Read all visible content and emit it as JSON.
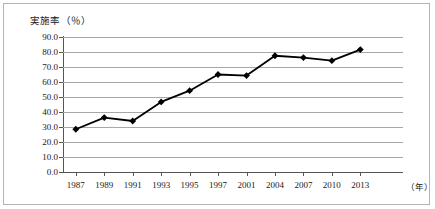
{
  "chart_data": {
    "type": "line",
    "title": "実施率（％）",
    "xlabel": "（年）",
    "ylabel": "実施率（％）",
    "categories": [
      "1987",
      "1989",
      "1991",
      "1993",
      "1995",
      "1997",
      "2001",
      "2004",
      "2007",
      "2010",
      "2013"
    ],
    "values": [
      28.5,
      36.3,
      34.0,
      46.7,
      54.2,
      65.0,
      64.3,
      77.5,
      76.3,
      74.2,
      81.6
    ],
    "series": [
      {
        "name": "実施率",
        "values": [
          28.5,
          36.3,
          34.0,
          46.7,
          54.2,
          65.0,
          64.3,
          77.5,
          76.3,
          74.2,
          81.6
        ]
      }
    ],
    "ylim": [
      0.0,
      90.0
    ],
    "ytick_step": 10.0,
    "ytick_labels": [
      "90.0",
      "80.0",
      "70.0",
      "60.0",
      "50.0",
      "40.0",
      "30.0",
      "20.0",
      "10.0",
      "0.0"
    ],
    "grid": true,
    "legend": false,
    "legend_position": "none",
    "marker": "diamond",
    "line_color": "#000000",
    "marker_color": "#000000",
    "grid_color": "#a8a8a8",
    "axis_color": "#555555",
    "border_color": "#b4b4b4",
    "background": "#ffffff"
  },
  "axis": {
    "y_title": "実施率（％）",
    "x_unit": "（年）"
  }
}
